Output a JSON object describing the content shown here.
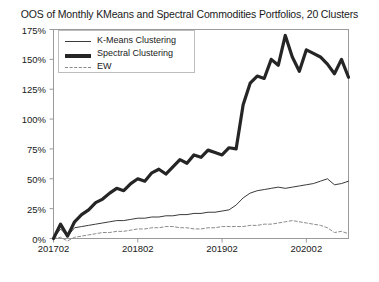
{
  "chart_data": {
    "type": "line",
    "title": "OOS of Monthly KMeans and Spectral Commodities Portfolios, 20 Clusters",
    "xlabel": "",
    "ylabel": "",
    "grid": false,
    "legend_position": "upper-left",
    "xlim": [
      201702,
      202008
    ],
    "ylim": [
      0,
      175
    ],
    "yticks": [
      "0%",
      "25%",
      "50%",
      "75%",
      "100%",
      "125%",
      "150%",
      "175%"
    ],
    "ytick_values": [
      0,
      25,
      50,
      75,
      100,
      125,
      150,
      175
    ],
    "xticks": [
      "201702",
      "201802",
      "201902",
      "202002"
    ],
    "xtick_values": [
      201702,
      201802,
      201902,
      202002
    ],
    "x": [
      0,
      1,
      2,
      3,
      4,
      5,
      6,
      7,
      8,
      9,
      10,
      11,
      12,
      13,
      14,
      15,
      16,
      17,
      18,
      19,
      20,
      21,
      22,
      23,
      24,
      25,
      26,
      27,
      28,
      29,
      30,
      31,
      32,
      33,
      34,
      35,
      36,
      37,
      38,
      39,
      40,
      41,
      42
    ],
    "series": [
      {
        "name": "K-Means Clustering",
        "style": "solid-thin",
        "color": "#3a3a3a",
        "values": [
          0,
          8,
          2,
          9,
          10,
          11,
          12,
          13,
          14,
          15,
          15,
          16,
          17,
          17,
          18,
          18,
          19,
          19,
          20,
          20,
          21,
          21,
          22,
          22,
          23,
          24,
          28,
          34,
          38,
          40,
          41,
          42,
          43,
          42,
          43,
          44,
          45,
          46,
          48,
          50,
          45,
          46,
          48
        ]
      },
      {
        "name": "Spectral Clustering",
        "style": "solid-thick",
        "color": "#252525",
        "values": [
          0,
          12,
          2,
          14,
          20,
          24,
          30,
          33,
          38,
          42,
          40,
          46,
          50,
          48,
          55,
          58,
          54,
          60,
          66,
          63,
          70,
          68,
          74,
          72,
          70,
          76,
          75,
          112,
          130,
          136,
          134,
          150,
          145,
          170,
          152,
          140,
          158,
          155,
          152,
          146,
          138,
          150,
          135
        ]
      },
      {
        "name": "EW",
        "style": "dashed",
        "color": "#8a8a8a",
        "values": [
          0,
          1,
          -2,
          1,
          2,
          3,
          4,
          5,
          5,
          6,
          6,
          7,
          8,
          8,
          9,
          9,
          10,
          10,
          9,
          9,
          8,
          8,
          9,
          9,
          10,
          10,
          10,
          10,
          11,
          11,
          12,
          12,
          13,
          14,
          15,
          14,
          13,
          12,
          11,
          9,
          5,
          6,
          4
        ]
      }
    ]
  },
  "legend": {
    "items": [
      {
        "label": "K-Means Clustering"
      },
      {
        "label": "Spectral Clustering"
      },
      {
        "label": "EW"
      }
    ]
  },
  "colors": {
    "kmeans": "#3a3a3a",
    "spectral": "#252525",
    "ew": "#8a8a8a",
    "axis": "#9a9a9a",
    "background": "#ffffff"
  }
}
